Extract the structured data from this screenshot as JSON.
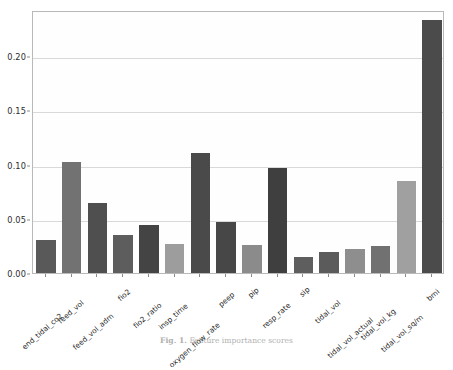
{
  "chart_data": {
    "type": "bar",
    "title": "",
    "xlabel": "",
    "ylabel": "",
    "ylim": [
      0.0,
      0.2425
    ],
    "grid": true,
    "legend": "none",
    "yticks": [
      "0.00",
      "0.05",
      "0.10",
      "0.15",
      "0.20"
    ],
    "ytick_values": [
      0.0,
      0.05,
      0.1,
      0.15,
      0.2
    ],
    "categories": [
      "end_tidal_co2",
      "feed_vol",
      "feed_vol_adm",
      "fio2",
      "fio2_ratio",
      "insp_time",
      "oxygen_flow_rate",
      "peep",
      "pip",
      "resp_rate",
      "sip",
      "tidal_vol",
      "tidal_vol_actual",
      "tidal_vol_kg",
      "tidal_vol_sq/m",
      "bmi"
    ],
    "values": [
      0.03,
      0.1023,
      0.0648,
      0.0352,
      0.0444,
      0.0268,
      0.111,
      0.0475,
      0.0262,
      0.0966,
      0.015,
      0.0196,
      0.0222,
      0.0247,
      0.0853,
      0.233
    ],
    "bar_colors": [
      "#595959",
      "#727272",
      "#4f4f4f",
      "#5d5d5d",
      "#444444",
      "#9d9d9d",
      "#4a4a4a",
      "#474747",
      "#8b8b8b",
      "#3f3f3f",
      "#5e5e5e",
      "#5b5b5b",
      "#8e8e8e",
      "#717171",
      "#a0a0a0",
      "#4b4b4b"
    ]
  },
  "caption": {
    "label": "Fig. 1.",
    "text": "Feature importance scores"
  },
  "colors": {
    "axis": "#b9b9b9",
    "grid": "#d9d9d9",
    "tick_text": "#2b2b2b",
    "background": "#ffffff"
  }
}
